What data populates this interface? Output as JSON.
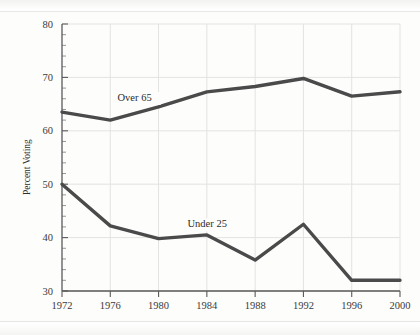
{
  "page": {
    "cropped_header_text": "",
    "background_color": "#fdfdfc"
  },
  "chart_data": {
    "type": "line",
    "title": "",
    "xlabel": "",
    "ylabel": "Percent Voting",
    "categories": [
      1972,
      1976,
      1980,
      1984,
      1988,
      1992,
      1996,
      2000
    ],
    "xtick_labels": [
      "1972",
      "1976",
      "1980",
      "1984",
      "1988",
      "1992",
      "1996",
      "2000"
    ],
    "ytick_labels": [
      "80",
      "70",
      "60",
      "50",
      "40",
      "30"
    ],
    "ytick_values": [
      80,
      70,
      60,
      50,
      40,
      30
    ],
    "ylim": [
      30,
      80
    ],
    "xlim": [
      1972,
      2000
    ],
    "grid": true,
    "legend_position": "inline-annotations",
    "line_color": "#4a4a4a",
    "grid_color": "#e3e3e1",
    "axis_color": "#5a5a5a",
    "series": [
      {
        "name": "Over 65",
        "label": "Over 65",
        "values": [
          63.5,
          62.0,
          64.5,
          67.3,
          68.3,
          69.8,
          66.5,
          67.3
        ]
      },
      {
        "name": "Under 25",
        "label": "Under 25",
        "values": [
          50.0,
          42.2,
          39.8,
          40.5,
          35.8,
          42.5,
          32.0,
          32.0
        ]
      }
    ],
    "annotations": [
      {
        "text": "Over 65",
        "x": 1976.6,
        "y": 65.6
      },
      {
        "text": "Under 25",
        "x": 1982.4,
        "y": 41.9
      }
    ]
  }
}
